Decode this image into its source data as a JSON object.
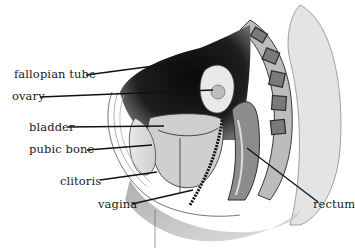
{
  "diagram": {
    "type": "anatomical cross-section",
    "labels": [
      {
        "id": "fallopian_tube",
        "text": "fallopian tube",
        "x": 14,
        "y": 69,
        "line": [
          86,
          75,
          214,
          58
        ]
      },
      {
        "id": "ovary",
        "text": "ovary",
        "x": 12,
        "y": 91,
        "line": [
          40,
          97,
          213,
          90
        ]
      },
      {
        "id": "bladder",
        "text": "bladder",
        "x": 29,
        "y": 122,
        "line": [
          68,
          127,
          164,
          126
        ]
      },
      {
        "id": "pubic_bone",
        "text": "pubic bone",
        "x": 29,
        "y": 144,
        "line": [
          87,
          150,
          152,
          145
        ]
      },
      {
        "id": "clitoris",
        "text": "clitoris",
        "x": 60,
        "y": 182,
        "line": [
          100,
          180,
          157,
          172
        ]
      },
      {
        "id": "vagina",
        "text": "vagina",
        "x": 98,
        "y": 205,
        "line": [
          132,
          204,
          193,
          190
        ]
      },
      {
        "id": "rectum",
        "text": "rectum",
        "x": 313,
        "y": 204,
        "line": [
          247,
          148,
          318,
          202
        ]
      }
    ]
  }
}
